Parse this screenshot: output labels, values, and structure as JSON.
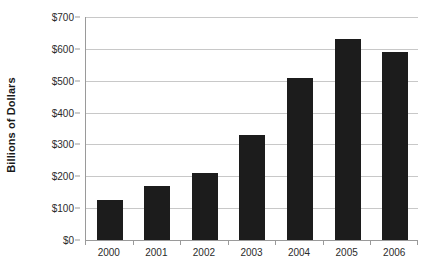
{
  "chart_data": {
    "type": "bar",
    "title": "",
    "subtitle": "",
    "xlabel": "",
    "ylabel": "Billions of Dollars",
    "categories": [
      "2000",
      "2001",
      "2002",
      "2003",
      "2004",
      "2005",
      "2006"
    ],
    "values": [
      127,
      170,
      210,
      330,
      508,
      630,
      590
    ],
    "ylim": [
      0,
      700
    ],
    "ytick_values": [
      0,
      100,
      200,
      300,
      400,
      500,
      600,
      700
    ],
    "ytick_labels": [
      "$0",
      "$100",
      "$200",
      "$300",
      "$400",
      "$500",
      "$600",
      "$700"
    ],
    "grid": true,
    "grid_axis": "y",
    "legend": false,
    "legend_position": "none",
    "bar_color": "#1c1c1c",
    "gridline_color": "#c8c8c8",
    "axis_color": "#9a9a9a",
    "background_color": "#ffffff",
    "series": [
      {
        "name": "Billions of Dollars",
        "values": [
          127,
          170,
          210,
          330,
          508,
          630,
          590
        ]
      }
    ]
  }
}
